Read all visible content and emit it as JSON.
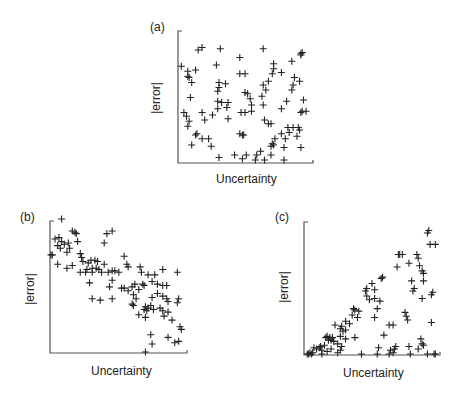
{
  "header_fragment": "",
  "chart_data": [
    {
      "type": "scatter",
      "panel": "(a)",
      "title": "(a)",
      "xlabel": "Uncertainty",
      "ylabel": "|error|",
      "marker": "+",
      "grid": false,
      "xlim": [
        0,
        1
      ],
      "ylim": [
        0,
        1
      ],
      "note": "No correlation: points scattered uniformly",
      "points": [
        [
          0.14,
          0.88
        ],
        [
          0.17,
          0.9
        ],
        [
          0.31,
          0.89
        ],
        [
          0.64,
          0.89
        ],
        [
          0.93,
          0.85
        ],
        [
          0.94,
          0.86
        ],
        [
          0.93,
          0.84
        ],
        [
          0.01,
          0.75
        ],
        [
          0.28,
          0.76
        ],
        [
          0.46,
          0.82
        ],
        [
          0.72,
          0.77
        ],
        [
          0.86,
          0.79
        ],
        [
          0.06,
          0.71
        ],
        [
          0.12,
          0.72
        ],
        [
          0.06,
          0.67
        ],
        [
          0.07,
          0.66
        ],
        [
          0.09,
          0.62
        ],
        [
          0.46,
          0.69
        ],
        [
          0.5,
          0.69
        ],
        [
          0.72,
          0.73
        ],
        [
          0.71,
          0.69
        ],
        [
          0.78,
          0.7
        ],
        [
          0.68,
          0.63
        ],
        [
          0.3,
          0.62
        ],
        [
          0.35,
          0.61
        ],
        [
          0.3,
          0.58
        ],
        [
          0.29,
          0.55
        ],
        [
          0.5,
          0.54
        ],
        [
          0.52,
          0.53
        ],
        [
          0.64,
          0.6
        ],
        [
          0.66,
          0.56
        ],
        [
          0.88,
          0.66
        ],
        [
          0.92,
          0.63
        ],
        [
          0.87,
          0.6
        ],
        [
          0.86,
          0.56
        ],
        [
          0.08,
          0.5
        ],
        [
          0.29,
          0.47
        ],
        [
          0.32,
          0.46
        ],
        [
          0.37,
          0.46
        ],
        [
          0.54,
          0.49
        ],
        [
          0.63,
          0.51
        ],
        [
          0.82,
          0.47
        ],
        [
          0.95,
          0.48
        ],
        [
          0.55,
          0.44
        ],
        [
          0.36,
          0.42
        ],
        [
          0.29,
          0.41
        ],
        [
          0.64,
          0.44
        ],
        [
          0.78,
          0.41
        ],
        [
          0.03,
          0.38
        ],
        [
          0.05,
          0.35
        ],
        [
          0.17,
          0.38
        ],
        [
          0.25,
          0.36
        ],
        [
          0.47,
          0.38
        ],
        [
          0.5,
          0.38
        ],
        [
          0.55,
          0.39
        ],
        [
          0.94,
          0.39
        ],
        [
          0.97,
          0.39
        ],
        [
          0.93,
          0.38
        ],
        [
          0.07,
          0.31
        ],
        [
          0.19,
          0.32
        ],
        [
          0.37,
          0.33
        ],
        [
          0.65,
          0.32
        ],
        [
          0.68,
          0.29
        ],
        [
          0.7,
          0.29
        ],
        [
          0.06,
          0.27
        ],
        [
          0.83,
          0.26
        ],
        [
          0.87,
          0.26
        ],
        [
          0.91,
          0.26
        ],
        [
          0.84,
          0.22
        ],
        [
          0.92,
          0.24
        ],
        [
          0.78,
          0.21
        ],
        [
          0.12,
          0.2
        ],
        [
          0.13,
          0.21
        ],
        [
          0.17,
          0.17
        ],
        [
          0.22,
          0.17
        ],
        [
          0.46,
          0.21
        ],
        [
          0.48,
          0.2
        ],
        [
          0.49,
          0.2
        ],
        [
          0.73,
          0.17
        ],
        [
          0.81,
          0.17
        ],
        [
          0.9,
          0.19
        ],
        [
          0.09,
          0.12
        ],
        [
          0.24,
          0.11
        ],
        [
          0.7,
          0.11
        ],
        [
          0.71,
          0.13
        ],
        [
          0.72,
          0.12
        ],
        [
          0.8,
          0.1
        ],
        [
          0.93,
          0.1
        ],
        [
          0.62,
          0.07
        ],
        [
          0.3,
          0.02
        ],
        [
          0.42,
          0.04
        ],
        [
          0.51,
          0.04
        ],
        [
          0.59,
          0.04
        ],
        [
          0.7,
          0.04
        ],
        [
          0.58,
          0.0
        ],
        [
          0.65,
          0.0
        ],
        [
          0.8,
          0.0
        ],
        [
          0.48,
          0.01
        ]
      ]
    },
    {
      "type": "scatter",
      "panel": "(b)",
      "title": "(b)",
      "xlabel": "Uncertainty",
      "ylabel": "|error|",
      "marker": "+",
      "grid": false,
      "xlim": [
        0,
        1
      ],
      "ylim": [
        0,
        1
      ],
      "note": "Negative correlation: error decreases as uncertainty increases",
      "points": [
        [
          0.08,
          1.0
        ],
        [
          0.16,
          0.91
        ],
        [
          0.18,
          0.9
        ],
        [
          0.19,
          0.89
        ],
        [
          0.42,
          0.89
        ],
        [
          0.46,
          0.91
        ],
        [
          0.4,
          0.82
        ],
        [
          0.03,
          0.85
        ],
        [
          0.06,
          0.86
        ],
        [
          0.08,
          0.83
        ],
        [
          0.1,
          0.81
        ],
        [
          0.13,
          0.82
        ],
        [
          0.2,
          0.83
        ],
        [
          0.05,
          0.8
        ],
        [
          0.07,
          0.78
        ],
        [
          0.14,
          0.78
        ],
        [
          0.12,
          0.75
        ],
        [
          0.22,
          0.74
        ],
        [
          0.0,
          0.73
        ],
        [
          0.01,
          0.73
        ],
        [
          0.05,
          0.66
        ],
        [
          0.12,
          0.63
        ],
        [
          0.16,
          0.65
        ],
        [
          0.23,
          0.71
        ],
        [
          0.24,
          0.68
        ],
        [
          0.28,
          0.67
        ],
        [
          0.3,
          0.69
        ],
        [
          0.33,
          0.69
        ],
        [
          0.35,
          0.68
        ],
        [
          0.4,
          0.66
        ],
        [
          0.27,
          0.62
        ],
        [
          0.31,
          0.63
        ],
        [
          0.34,
          0.63
        ],
        [
          0.36,
          0.62
        ],
        [
          0.22,
          0.6
        ],
        [
          0.26,
          0.6
        ],
        [
          0.31,
          0.6
        ],
        [
          0.38,
          0.6
        ],
        [
          0.43,
          0.6
        ],
        [
          0.46,
          0.61
        ],
        [
          0.48,
          0.61
        ],
        [
          0.51,
          0.6
        ],
        [
          0.55,
          0.72
        ],
        [
          0.57,
          0.66
        ],
        [
          0.58,
          0.64
        ],
        [
          0.67,
          0.64
        ],
        [
          0.68,
          0.6
        ],
        [
          0.73,
          0.58
        ],
        [
          0.78,
          0.58
        ],
        [
          0.84,
          0.62
        ],
        [
          0.95,
          0.6
        ],
        [
          0.29,
          0.52
        ],
        [
          0.46,
          0.54
        ],
        [
          0.44,
          0.49
        ],
        [
          0.53,
          0.48
        ],
        [
          0.55,
          0.48
        ],
        [
          0.61,
          0.49
        ],
        [
          0.63,
          0.51
        ],
        [
          0.66,
          0.47
        ],
        [
          0.69,
          0.51
        ],
        [
          0.7,
          0.5
        ],
        [
          0.76,
          0.53
        ],
        [
          0.8,
          0.51
        ],
        [
          0.84,
          0.5
        ],
        [
          0.87,
          0.5
        ],
        [
          0.58,
          0.46
        ],
        [
          0.62,
          0.43
        ],
        [
          0.64,
          0.4
        ],
        [
          0.8,
          0.44
        ],
        [
          0.84,
          0.42
        ],
        [
          0.87,
          0.4
        ],
        [
          0.31,
          0.4
        ],
        [
          0.37,
          0.39
        ],
        [
          0.46,
          0.4
        ],
        [
          0.61,
          0.36
        ],
        [
          0.62,
          0.35
        ],
        [
          0.76,
          0.41
        ],
        [
          0.88,
          0.38
        ],
        [
          0.96,
          0.4
        ],
        [
          0.95,
          0.37
        ],
        [
          0.75,
          0.35
        ],
        [
          0.73,
          0.33
        ],
        [
          0.7,
          0.32
        ],
        [
          0.71,
          0.34
        ],
        [
          0.84,
          0.31
        ],
        [
          0.88,
          0.3
        ],
        [
          0.72,
          0.31
        ],
        [
          0.66,
          0.28
        ],
        [
          0.71,
          0.26
        ],
        [
          0.85,
          0.27
        ],
        [
          0.91,
          0.24
        ],
        [
          0.97,
          0.19
        ],
        [
          0.98,
          0.17
        ],
        [
          0.77,
          0.32
        ],
        [
          0.82,
          0.33
        ],
        [
          0.96,
          0.08
        ],
        [
          0.93,
          0.07
        ],
        [
          0.88,
          0.11
        ],
        [
          0.75,
          0.13
        ],
        [
          0.76,
          0.06
        ],
        [
          0.71,
          0.0
        ]
      ]
    },
    {
      "type": "scatter",
      "panel": "(c)",
      "title": "(c)",
      "xlabel": "Uncertainty",
      "ylabel": "|error|",
      "marker": "+",
      "grid": false,
      "xlim": [
        0,
        1
      ],
      "ylim": [
        0,
        1
      ],
      "note": "Positive correlation: error bounded by and increasing with uncertainty (wedge shape)",
      "points": [
        [
          0.93,
          0.98
        ],
        [
          0.92,
          0.96
        ],
        [
          0.94,
          0.87
        ],
        [
          0.98,
          0.87
        ],
        [
          0.7,
          0.79
        ],
        [
          0.71,
          0.79
        ],
        [
          0.73,
          0.79
        ],
        [
          0.84,
          0.79
        ],
        [
          0.85,
          0.76
        ],
        [
          0.78,
          0.72
        ],
        [
          0.69,
          0.69
        ],
        [
          0.86,
          0.7
        ],
        [
          0.88,
          0.66
        ],
        [
          0.89,
          0.64
        ],
        [
          0.57,
          0.6
        ],
        [
          0.58,
          0.61
        ],
        [
          0.8,
          0.58
        ],
        [
          0.89,
          0.58
        ],
        [
          0.5,
          0.56
        ],
        [
          0.46,
          0.52
        ],
        [
          0.45,
          0.5
        ],
        [
          0.52,
          0.51
        ],
        [
          0.82,
          0.52
        ],
        [
          0.81,
          0.5
        ],
        [
          0.96,
          0.49
        ],
        [
          0.95,
          0.47
        ],
        [
          0.88,
          0.44
        ],
        [
          0.46,
          0.46
        ],
        [
          0.48,
          0.43
        ],
        [
          0.52,
          0.44
        ],
        [
          0.56,
          0.42
        ],
        [
          0.36,
          0.36
        ],
        [
          0.37,
          0.35
        ],
        [
          0.4,
          0.34
        ],
        [
          0.54,
          0.36
        ],
        [
          0.35,
          0.31
        ],
        [
          0.39,
          0.29
        ],
        [
          0.52,
          0.29
        ],
        [
          0.75,
          0.33
        ],
        [
          0.76,
          0.3
        ],
        [
          0.77,
          0.27
        ],
        [
          0.95,
          0.25
        ],
        [
          0.3,
          0.26
        ],
        [
          0.33,
          0.24
        ],
        [
          0.27,
          0.22
        ],
        [
          0.22,
          0.23
        ],
        [
          0.26,
          0.2
        ],
        [
          0.28,
          0.18
        ],
        [
          0.3,
          0.19
        ],
        [
          0.63,
          0.23
        ],
        [
          0.66,
          0.23
        ],
        [
          0.15,
          0.13
        ],
        [
          0.16,
          0.14
        ],
        [
          0.18,
          0.13
        ],
        [
          0.2,
          0.13
        ],
        [
          0.17,
          0.11
        ],
        [
          0.19,
          0.11
        ],
        [
          0.21,
          0.1
        ],
        [
          0.26,
          0.14
        ],
        [
          0.3,
          0.12
        ],
        [
          0.24,
          0.08
        ],
        [
          0.27,
          0.06
        ],
        [
          0.37,
          0.13
        ],
        [
          0.59,
          0.15
        ],
        [
          0.87,
          0.12
        ],
        [
          0.88,
          0.08
        ],
        [
          0.89,
          0.07
        ],
        [
          0.78,
          0.06
        ],
        [
          0.85,
          0.04
        ],
        [
          0.06,
          0.05
        ],
        [
          0.08,
          0.04
        ],
        [
          0.1,
          0.05
        ],
        [
          0.12,
          0.03
        ],
        [
          0.11,
          0.06
        ],
        [
          0.14,
          0.07
        ],
        [
          0.16,
          0.02
        ],
        [
          0.19,
          0.04
        ],
        [
          0.03,
          0.01
        ],
        [
          0.04,
          0.0
        ],
        [
          0.05,
          0.01
        ],
        [
          0.01,
          0.0
        ],
        [
          0.02,
          0.0
        ],
        [
          0.12,
          0.0
        ],
        [
          0.24,
          0.01
        ],
        [
          0.26,
          0.03
        ],
        [
          0.42,
          0.0
        ],
        [
          0.54,
          0.0
        ],
        [
          0.55,
          0.05
        ],
        [
          0.63,
          0.0
        ],
        [
          0.64,
          0.03
        ],
        [
          0.68,
          0.06
        ],
        [
          0.67,
          0.04
        ],
        [
          0.66,
          0.01
        ],
        [
          0.79,
          0.0
        ],
        [
          0.92,
          0.0
        ],
        [
          0.97,
          0.0
        ],
        [
          0.98,
          0.0
        ]
      ]
    }
  ],
  "panels": [
    {
      "label": "(a)",
      "xlabel": "Uncertainty",
      "ylabel": "|error|"
    },
    {
      "label": "(b)",
      "xlabel": "Uncertainty",
      "ylabel": "|error|"
    },
    {
      "label": "(c)",
      "xlabel": "Uncertainty",
      "ylabel": "|error|"
    }
  ]
}
